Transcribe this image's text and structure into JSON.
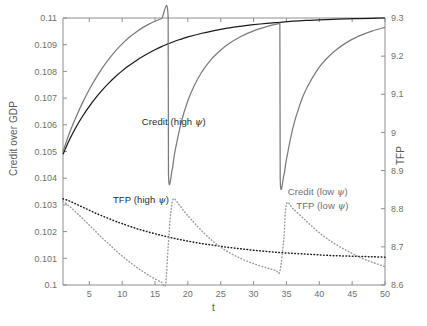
{
  "chart_data": {
    "type": "line",
    "title": "",
    "xlabel": "t",
    "ylabel": "Credit over GDP",
    "ylabel_right": "TFP",
    "xlim": [
      1,
      50
    ],
    "ylim_left": [
      0.1,
      0.11
    ],
    "ylim_right": [
      8.6,
      9.3
    ],
    "grid": false,
    "legend_position": "inline-annotations",
    "xticks": [
      5,
      10,
      15,
      20,
      25,
      30,
      35,
      40,
      45,
      50
    ],
    "xtick_labels": [
      "5",
      "10",
      "15",
      "20",
      "25",
      "30",
      "35",
      "40",
      "45",
      "50"
    ],
    "yticks_left": [
      0.1,
      0.101,
      0.102,
      0.103,
      0.104,
      0.105,
      0.106,
      0.107,
      0.108,
      0.109,
      0.11
    ],
    "ytick_labels_left": [
      "0.1",
      "0.101",
      "0.102",
      "0.103",
      "0.104",
      "0.105",
      "0.106",
      "0.107",
      "0.108",
      "0.109",
      "0.11"
    ],
    "yticks_right": [
      8.6,
      8.7,
      8.8,
      8.9,
      9.0,
      9.1,
      9.2,
      9.3
    ],
    "ytick_labels_right": [
      "8.6",
      "8.7",
      "8.8",
      "8.9",
      "9",
      "9.1",
      "9.2",
      "9.3"
    ],
    "colors": {
      "credit_high": "#1a1a1a",
      "credit_low": "#7a7b7d",
      "tfp_high": "#1a1a1a",
      "tfp_low": "#9a9b9d",
      "axis": "#8d8e90",
      "text": "#58595b"
    },
    "series": [
      {
        "name": "Credit (high ψ)",
        "axis": "left",
        "style": "solid",
        "color": "#1a1a1a",
        "label_x": 13.0,
        "label_y": 0.10605,
        "x": [
          1,
          2,
          3,
          4,
          5,
          6,
          7,
          8,
          9,
          10,
          11,
          12,
          13,
          14,
          15,
          16,
          17,
          18,
          19,
          20,
          22,
          24,
          26,
          28,
          30,
          32,
          34,
          36,
          38,
          40,
          42,
          44,
          46,
          48,
          50
        ],
        "y": [
          0.1049,
          0.10545,
          0.10592,
          0.10633,
          0.10669,
          0.10702,
          0.10731,
          0.10757,
          0.10781,
          0.10802,
          0.10821,
          0.10838,
          0.10854,
          0.10868,
          0.10881,
          0.10893,
          0.10903,
          0.10913,
          0.10921,
          0.10929,
          0.10942,
          0.10953,
          0.10962,
          0.10969,
          0.10975,
          0.1098,
          0.10984,
          0.10988,
          0.10991,
          0.10993,
          0.10995,
          0.10997,
          0.10998,
          0.10999,
          0.11
        ]
      },
      {
        "name": "Credit (low ψ)",
        "axis": "left",
        "style": "solid",
        "color": "#7a7b7d",
        "label_x": 35.2,
        "label_y": 0.10345,
        "crash_times": [
          17,
          34
        ],
        "x": [
          1,
          2,
          3,
          4,
          5,
          6,
          7,
          8,
          9,
          10,
          11,
          12,
          13,
          14,
          15,
          16,
          17,
          17.05,
          17.6,
          18,
          19,
          20,
          21,
          22,
          23,
          24,
          26,
          28,
          30,
          32,
          33.9,
          34,
          34.05,
          34.6,
          35,
          36,
          37,
          38,
          40,
          42,
          44,
          46,
          48,
          50
        ],
        "y": [
          0.105,
          0.1057,
          0.1063,
          0.10684,
          0.10732,
          0.10775,
          0.10813,
          0.10847,
          0.10877,
          0.10903,
          0.10926,
          0.10945,
          0.10962,
          0.10976,
          0.10988,
          0.10998,
          0.11005,
          0.10418,
          0.1043,
          0.10495,
          0.1061,
          0.1069,
          0.10748,
          0.10793,
          0.10828,
          0.10857,
          0.109,
          0.1093,
          0.10952,
          0.10968,
          0.1098,
          0.10982,
          0.104,
          0.1041,
          0.1047,
          0.1059,
          0.10672,
          0.10733,
          0.10816,
          0.10869,
          0.10906,
          0.10932,
          0.10951,
          0.10965
        ]
      },
      {
        "name": "TFP (high ψ)",
        "axis": "right",
        "style": "dotted",
        "color": "#1a1a1a",
        "label_x": 8.6,
        "label_y_right": 8.82,
        "x": [
          1,
          2,
          3,
          4,
          5,
          6,
          7,
          8,
          9,
          10,
          12,
          14,
          16,
          18,
          20,
          22,
          24,
          26,
          28,
          30,
          32,
          34,
          36,
          38,
          40,
          42,
          44,
          46,
          48,
          50
        ],
        "y": [
          8.826,
          8.82,
          8.812,
          8.804,
          8.796,
          8.788,
          8.781,
          8.774,
          8.767,
          8.761,
          8.749,
          8.739,
          8.73,
          8.722,
          8.715,
          8.709,
          8.704,
          8.699,
          8.695,
          8.691,
          8.688,
          8.685,
          8.683,
          8.681,
          8.679,
          8.677,
          8.676,
          8.675,
          8.674,
          8.673
        ]
      },
      {
        "name": "TFP (low ψ)",
        "axis": "right",
        "style": "dotted",
        "color": "#9a9b9d",
        "label_x": 36.5,
        "label_y_right": 8.805,
        "peak_times": [
          17.8,
          35.0
        ],
        "x": [
          1,
          2,
          3,
          4,
          5,
          6,
          7,
          8,
          9,
          10,
          11,
          12,
          13,
          14,
          15,
          16,
          16.6,
          17,
          17.4,
          17.8,
          18.6,
          19.5,
          20.5,
          22,
          24,
          26,
          28,
          30,
          32,
          33.2,
          33.5,
          34,
          34.6,
          35,
          36,
          38,
          40,
          42,
          44,
          46,
          48,
          50
        ],
        "y": [
          8.82,
          8.806,
          8.79,
          8.774,
          8.757,
          8.74,
          8.723,
          8.707,
          8.691,
          8.676,
          8.662,
          8.649,
          8.637,
          8.626,
          8.616,
          8.607,
          8.602,
          8.7,
          8.79,
          8.826,
          8.812,
          8.792,
          8.772,
          8.744,
          8.712,
          8.688,
          8.67,
          8.656,
          8.645,
          8.639,
          8.637,
          8.636,
          8.72,
          8.812,
          8.8,
          8.768,
          8.737,
          8.712,
          8.692,
          8.674,
          8.66,
          8.648
        ]
      }
    ]
  },
  "labels": {
    "credit_high": "Credit (high ",
    "credit_low": "Credit (low ",
    "tfp_high": "TFP (high ",
    "tfp_low": "TFP (low ",
    "psi": "ψ",
    "paren_close": ")",
    "xlabel": "t",
    "ylabel_left": "Credit over GDP",
    "ylabel_right": "TFP"
  }
}
